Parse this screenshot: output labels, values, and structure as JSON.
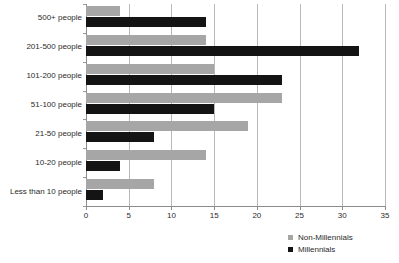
{
  "chart_data": {
    "type": "bar",
    "orientation": "horizontal",
    "title": "",
    "subtitle": "",
    "xlabel": "",
    "ylabel": "",
    "xlim": [
      0,
      35
    ],
    "xticks": [
      0,
      5,
      10,
      15,
      20,
      25,
      30,
      35
    ],
    "grid": true,
    "grid_axis": "x",
    "legend_position": "bottom-right",
    "categories": [
      "500+ people",
      "201-500 people",
      "101-200 people",
      "51-100 people",
      "21-50 people",
      "10-20 people",
      "Less than 10 people"
    ],
    "series": [
      {
        "name": "Non-Millennials",
        "color": "#a6a6a6",
        "values": [
          4,
          14,
          15,
          23,
          19,
          14,
          8
        ]
      },
      {
        "name": "Millennials",
        "color": "#141414",
        "values": [
          14,
          32,
          23,
          15,
          8,
          4,
          2
        ]
      }
    ]
  },
  "colors": {
    "background": "#ffffff",
    "gridline": "#b9b9b9",
    "axis": "#8c8c8c",
    "text": "#2b2b2b",
    "non_millennials": "#a6a6a6",
    "millennials": "#141414"
  }
}
